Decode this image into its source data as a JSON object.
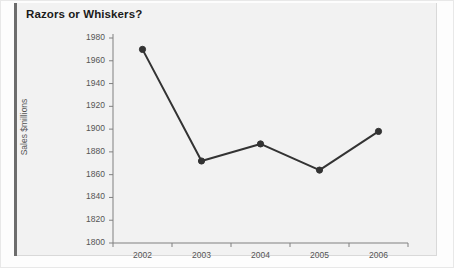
{
  "chart_data": {
    "type": "line",
    "title": "Razors or Whiskers?",
    "xlabel": "",
    "ylabel": "Sales $millions",
    "categories": [
      "2002",
      "2003",
      "2004",
      "2005",
      "2006"
    ],
    "values": [
      1970,
      1872,
      1887,
      1864,
      1898
    ],
    "series": [
      {
        "name": "Sales",
        "values": [
          1970,
          1872,
          1887,
          1864,
          1898
        ]
      }
    ],
    "ylim": [
      1800,
      1980
    ],
    "ytick_step": 20,
    "yticks": [
      1800,
      1820,
      1840,
      1860,
      1880,
      1900,
      1920,
      1940,
      1960,
      1980
    ],
    "grid": false,
    "legend": "none",
    "marker": "circle",
    "line_color": "#333333",
    "marker_color": "#333333",
    "panel_color": "#f2f2f2",
    "axis_color": "#808080",
    "text_color": "#555555",
    "title_color": "#1b1b1b"
  },
  "figure": {
    "title": "Razors or Whiskers?"
  }
}
